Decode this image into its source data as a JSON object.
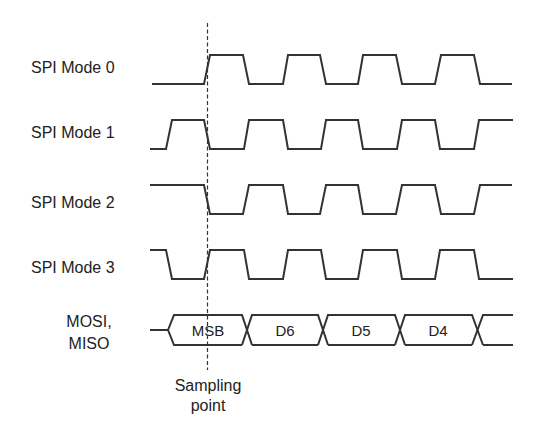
{
  "diagram": {
    "colors": {
      "line": "#333333",
      "text": "#222222",
      "background": "#ffffff"
    },
    "signals": [
      {
        "label": "SPI Mode 0",
        "idle": "low",
        "first_edge": "rising",
        "sample_edge": "leading"
      },
      {
        "label": "SPI Mode 1",
        "idle": "low",
        "first_edge": "rising",
        "sample_edge": "trailing"
      },
      {
        "label": "SPI Mode 2",
        "idle": "high",
        "first_edge": "falling",
        "sample_edge": "leading"
      },
      {
        "label": "SPI Mode 3",
        "idle": "high",
        "first_edge": "falling",
        "sample_edge": "trailing"
      }
    ],
    "data_bus": {
      "label_line1": "MOSI,",
      "label_line2": "MISO",
      "bits": [
        "MSB",
        "D6",
        "D5",
        "D4"
      ]
    },
    "marker": {
      "label_line1": "Sampling",
      "label_line2": "point"
    }
  }
}
